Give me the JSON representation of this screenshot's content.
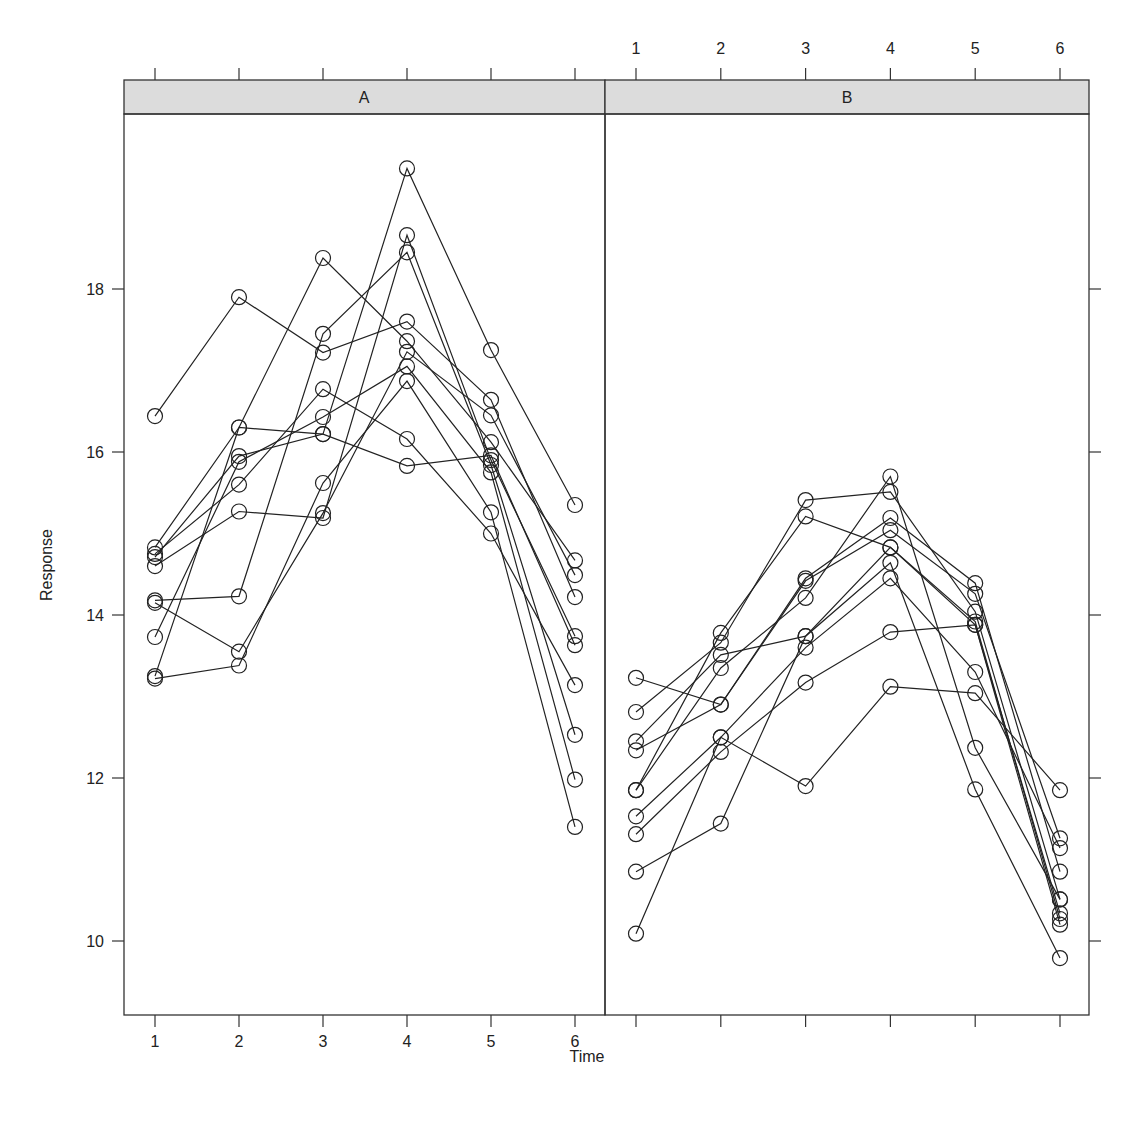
{
  "chart_data": {
    "type": "line",
    "title": "",
    "xlabel": "Time",
    "ylabel": "Response",
    "x": [
      1,
      2,
      3,
      4,
      5,
      6
    ],
    "x_tick_labels": [
      "1",
      "2",
      "3",
      "4",
      "5",
      "6"
    ],
    "y_ticks": [
      10,
      12,
      14,
      16,
      18
    ],
    "y_tick_labels": [
      "10",
      "12",
      "14",
      "16",
      "18"
    ],
    "ylim": [
      9.1,
      20.3
    ],
    "xlim": [
      0.65,
      6.35
    ],
    "grid": false,
    "marker": "open-circle",
    "line_color": "#222222",
    "strip_color": "#dcdcdc",
    "panels": [
      {
        "label": "A",
        "series": [
          {
            "name": "A1",
            "values": [
              16.44,
              17.9,
              17.22,
              17.6,
              16.64,
              14.22
            ]
          },
          {
            "name": "A2",
            "values": [
              14.83,
              16.3,
              18.38,
              17.36,
              16.12,
              14.67
            ]
          },
          {
            "name": "A3",
            "values": [
              14.71,
              15.95,
              16.22,
              19.48,
              17.25,
              15.35
            ]
          },
          {
            "name": "A4",
            "values": [
              14.6,
              15.27,
              15.19,
              18.66,
              15.9,
              13.74
            ]
          },
          {
            "name": "A5",
            "values": [
              14.18,
              14.23,
              17.45,
              18.45,
              15.84,
              12.53
            ]
          },
          {
            "name": "A6",
            "values": [
              14.15,
              13.55,
              15.25,
              17.23,
              16.45,
              14.49
            ]
          },
          {
            "name": "A7",
            "values": [
              13.73,
              15.88,
              16.43,
              17.05,
              15.75,
              11.98
            ]
          },
          {
            "name": "A8",
            "values": [
              13.25,
              16.3,
              16.22,
              15.83,
              15.96,
              13.63
            ]
          },
          {
            "name": "A9",
            "values": [
              13.22,
              13.38,
              15.62,
              16.87,
              15.26,
              11.4
            ]
          },
          {
            "name": "A10",
            "values": [
              14.75,
              15.6,
              16.77,
              16.16,
              15.0,
              13.14
            ]
          }
        ]
      },
      {
        "label": "B",
        "series": [
          {
            "name": "B1",
            "values": [
              13.23,
              12.9,
              14.42,
              15.04,
              14.26,
              11.26
            ]
          },
          {
            "name": "B2",
            "values": [
              12.81,
              13.66,
              15.41,
              15.51,
              14.04,
              10.51
            ]
          },
          {
            "name": "B3",
            "values": [
              12.45,
              13.51,
              13.74,
              14.83,
              13.88,
              10.34
            ]
          },
          {
            "name": "B4",
            "values": [
              12.34,
              12.9,
              14.45,
              15.19,
              14.39,
              10.85
            ]
          },
          {
            "name": "B5",
            "values": [
              11.85,
              13.78,
              15.21,
              14.83,
              13.92,
              10.27
            ]
          },
          {
            "name": "B6",
            "values": [
              11.85,
              13.35,
              14.21,
              15.7,
              12.37,
              10.51
            ]
          },
          {
            "name": "B7",
            "values": [
              11.53,
              12.5,
              13.6,
              14.45,
              13.3,
              11.14
            ]
          },
          {
            "name": "B8",
            "values": [
              11.31,
              12.32,
              13.17,
              13.79,
              13.88,
              10.2
            ]
          },
          {
            "name": "B9",
            "values": [
              10.85,
              11.44,
              13.74,
              14.64,
              11.86,
              9.79
            ]
          },
          {
            "name": "B10",
            "values": [
              10.09,
              12.5,
              11.9,
              13.12,
              13.04,
              11.85
            ]
          }
        ]
      }
    ]
  },
  "labels": {
    "xlabel": "Time",
    "ylabel": "Response",
    "panel_a": "A",
    "panel_b": "B",
    "caption": ""
  }
}
